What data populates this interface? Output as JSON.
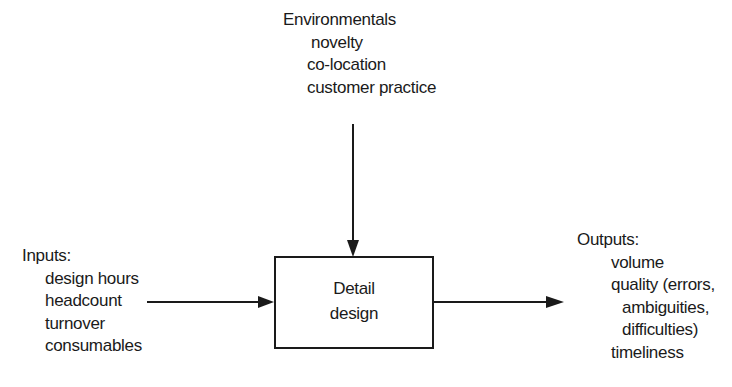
{
  "environmentals": {
    "title": "Environmentals",
    "items": [
      "novelty",
      "co-location",
      "customer practice"
    ]
  },
  "inputs": {
    "title": "Inputs:",
    "items": [
      "design hours",
      "headcount",
      "turnover",
      "consumables"
    ]
  },
  "process": {
    "line1": "Detail",
    "line2": "design"
  },
  "outputs": {
    "title": "Outputs:",
    "items": [
      "volume",
      "quality (errors,",
      "ambiguities,",
      "difficulties)",
      "timeliness"
    ]
  },
  "colors": {
    "ink": "#1a1a1a",
    "background": "#ffffff"
  }
}
